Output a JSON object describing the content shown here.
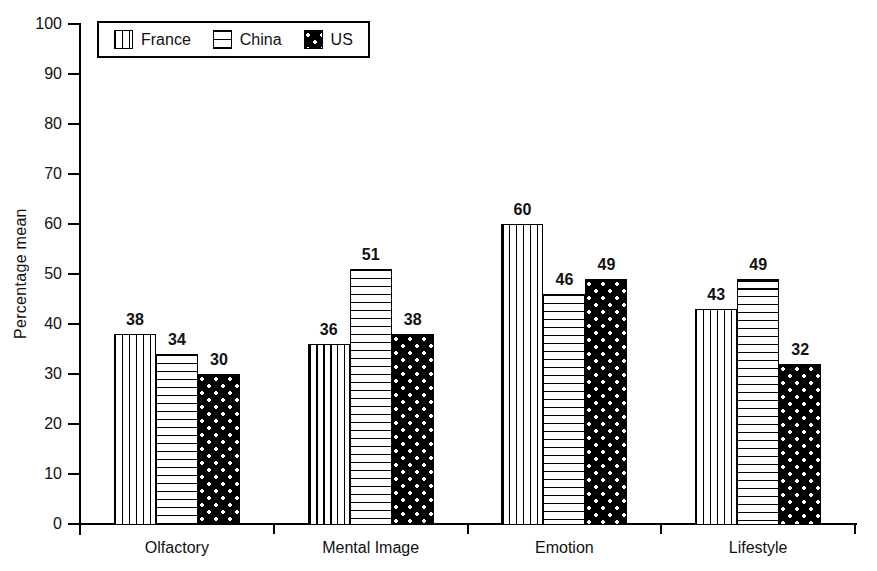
{
  "chart_data": {
    "type": "bar",
    "title": "",
    "xlabel": "",
    "ylabel": "Percentage mean",
    "ylim": [
      0,
      100
    ],
    "yticks": [
      0,
      10,
      20,
      30,
      40,
      50,
      60,
      70,
      80,
      90,
      100
    ],
    "grid": false,
    "legend_position": "top-left",
    "bar_labels": true,
    "categories": [
      "Olfactory",
      "Mental Image",
      "Emotion",
      "Lifestyle"
    ],
    "series": [
      {
        "name": "France",
        "pattern": "vertical-stripes",
        "values": [
          38,
          36,
          60,
          43
        ]
      },
      {
        "name": "China",
        "pattern": "horizontal-stripes",
        "values": [
          34,
          51,
          46,
          49
        ]
      },
      {
        "name": "US",
        "pattern": "black-dots",
        "values": [
          30,
          38,
          49,
          32
        ]
      }
    ]
  },
  "legend": {
    "items": [
      {
        "label": "France",
        "pattern": "vertical-stripes"
      },
      {
        "label": "China",
        "pattern": "horizontal-stripes"
      },
      {
        "label": "US",
        "pattern": "black-dots"
      }
    ]
  },
  "colors": {
    "background": "#ffffff",
    "axis": "#000000",
    "bar_outline": "#000000",
    "bar_fill_dark": "#000000",
    "text": "#111111"
  }
}
